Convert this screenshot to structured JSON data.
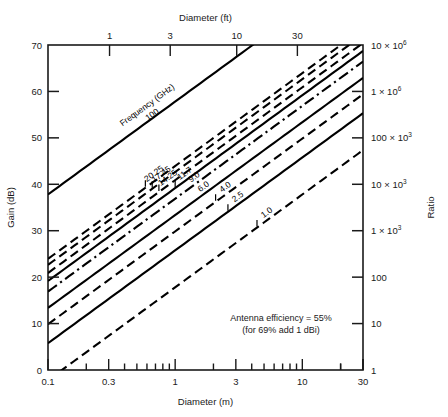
{
  "chart_data": {
    "type": "line",
    "title": "",
    "xlabel": "Diameter (m)",
    "xlabel_top": "Diameter (ft)",
    "ylabel": "Gain (dB)",
    "ylabel_right": "Ratio",
    "xlim": [
      0.1,
      30
    ],
    "ylim": [
      0,
      70
    ],
    "xscale": "log",
    "yscale": "linear",
    "grid": false,
    "legend_position": "inline-labels",
    "x_ticks": [
      "0.1",
      "0.3",
      "1",
      "3",
      "10",
      "30"
    ],
    "x_tick_values": [
      0.1,
      0.3,
      1,
      3,
      10,
      30
    ],
    "x_top_ticks": [
      "0.3",
      "1",
      "3",
      "10",
      "30",
      "100"
    ],
    "x_top_tick_values_ft": [
      0.3,
      1,
      3,
      10,
      30,
      100
    ],
    "y_ticks": [
      "0",
      "10",
      "20",
      "30",
      "40",
      "50",
      "60",
      "70"
    ],
    "y_tick_values": [
      0,
      10,
      20,
      30,
      40,
      50,
      60,
      70
    ],
    "y_right_ticks": [
      "1",
      "10",
      "100",
      "1 × 10",
      "10 × 10",
      "100 × 10",
      "1 × 10",
      "10 × 10"
    ],
    "y_right_full": [
      "1",
      "10",
      "100",
      "1 × 10³",
      "10 × 10³",
      "100 × 10³",
      "1 × 10⁶",
      "10 × 10⁶"
    ],
    "annotation": [
      "Antenna efficiency = 55%",
      "(for 69% add 1 dBi)"
    ],
    "series_title": "Frequency (GHz)",
    "efficiency": 0.55,
    "series": [
      {
        "name": "100",
        "freq_ghz": 100,
        "style": "solid",
        "label": "100"
      },
      {
        "name": "20.25",
        "freq_ghz": 20.25,
        "style": "dashed",
        "label": "20.25"
      },
      {
        "name": "17.45",
        "freq_ghz": 17.45,
        "style": "dashed",
        "label": "17.45"
      },
      {
        "name": "14.25",
        "freq_ghz": 14.25,
        "style": "dashed",
        "label": "14.25"
      },
      {
        "name": "11.7",
        "freq_ghz": 11.7,
        "style": "solid",
        "label": "11.7"
      },
      {
        "name": "9.0",
        "freq_ghz": 9.0,
        "style": "dashdot",
        "label": "9.0"
      },
      {
        "name": "6.0",
        "freq_ghz": 6.0,
        "style": "solid",
        "label": "6.0"
      },
      {
        "name": "4.0",
        "freq_ghz": 4.0,
        "style": "dashed",
        "label": "4.0"
      },
      {
        "name": "2.5",
        "freq_ghz": 2.5,
        "style": "solid",
        "label": "2.5"
      },
      {
        "name": "1.0",
        "freq_ghz": 1.0,
        "style": "dashed",
        "label": "1.0"
      }
    ]
  }
}
